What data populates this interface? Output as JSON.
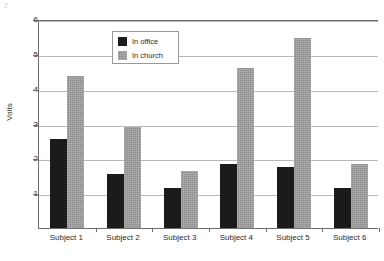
{
  "chart_data": {
    "type": "bar",
    "title": "",
    "xlabel": "",
    "ylabel": "Volts",
    "ylim": [
      0,
      6
    ],
    "yticks": [
      0,
      1,
      2,
      3,
      4,
      5,
      6
    ],
    "ytick_labels": [
      "",
      "1",
      "2",
      "3",
      "4",
      "5",
      "6"
    ],
    "grid": true,
    "legend_position": "upper center",
    "categories": [
      "Subject 1",
      "Subject 2",
      "Subject 3",
      "Subject 4",
      "Subject 5",
      "Subject 6"
    ],
    "series": [
      {
        "name": "In office",
        "color": "#1b1b1b",
        "values": [
          2.55,
          1.55,
          1.15,
          1.85,
          1.75,
          1.15
        ]
      },
      {
        "name": "In church",
        "color": "#8d8d8d",
        "values": [
          4.35,
          2.9,
          1.65,
          4.6,
          5.45,
          1.85
        ]
      }
    ]
  },
  "axes": {
    "y_axis_title": "Volts"
  },
  "legend": {
    "entries": [
      {
        "label": "In office"
      },
      {
        "label": "In church"
      }
    ]
  },
  "artifact": {
    "mark": "2"
  }
}
